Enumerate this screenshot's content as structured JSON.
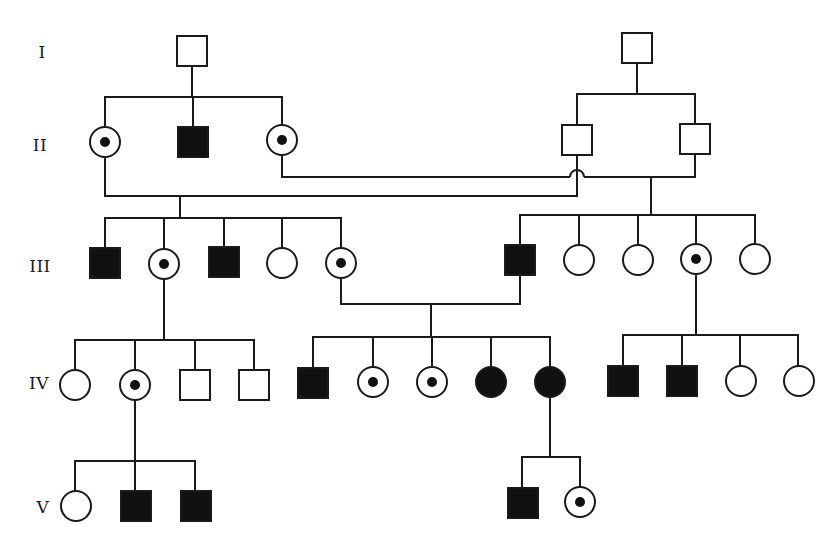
{
  "diagram": {
    "type": "pedigree",
    "colors": {
      "line": "#1a1a1a",
      "fill_affected": "#111111",
      "fill_unaffected": "#ffffff",
      "background": "#ffffff"
    },
    "legend_semantics": {
      "square": "male",
      "circle": "female",
      "filled": "affected",
      "dot": "carrier"
    },
    "generations": [
      {
        "label": "I",
        "x": 42,
        "y": 52
      },
      {
        "label": "II",
        "x": 40,
        "y": 145
      },
      {
        "label": "III",
        "x": 40,
        "y": 266
      },
      {
        "label": "IV",
        "x": 39,
        "y": 383
      },
      {
        "label": "V",
        "x": 43,
        "y": 507
      }
    ],
    "individuals": [
      {
        "id": "I-1",
        "sex": "male",
        "status": "unaffected",
        "cx": 192,
        "cy": 51
      },
      {
        "id": "I-2",
        "sex": "male",
        "status": "unaffected",
        "cx": 637,
        "cy": 48
      },
      {
        "id": "II-1",
        "sex": "female",
        "status": "carrier",
        "cx": 105,
        "cy": 142
      },
      {
        "id": "II-2",
        "sex": "male",
        "status": "affected",
        "cx": 193,
        "cy": 142
      },
      {
        "id": "II-3",
        "sex": "female",
        "status": "carrier",
        "cx": 282,
        "cy": 140
      },
      {
        "id": "II-4",
        "sex": "male",
        "status": "unaffected",
        "cx": 577,
        "cy": 140
      },
      {
        "id": "II-5",
        "sex": "male",
        "status": "unaffected",
        "cx": 695,
        "cy": 139
      },
      {
        "id": "III-1",
        "sex": "male",
        "status": "affected",
        "cx": 105,
        "cy": 263
      },
      {
        "id": "III-2",
        "sex": "female",
        "status": "carrier",
        "cx": 164,
        "cy": 264
      },
      {
        "id": "III-3",
        "sex": "male",
        "status": "affected",
        "cx": 224,
        "cy": 262
      },
      {
        "id": "III-4",
        "sex": "female",
        "status": "unaffected",
        "cx": 282,
        "cy": 263
      },
      {
        "id": "III-5",
        "sex": "female",
        "status": "carrier",
        "cx": 341,
        "cy": 263
      },
      {
        "id": "III-6",
        "sex": "male",
        "status": "affected",
        "cx": 520,
        "cy": 260
      },
      {
        "id": "III-7",
        "sex": "female",
        "status": "unaffected",
        "cx": 579,
        "cy": 260
      },
      {
        "id": "III-8",
        "sex": "female",
        "status": "unaffected",
        "cx": 638,
        "cy": 260
      },
      {
        "id": "III-9",
        "sex": "female",
        "status": "carrier",
        "cx": 696,
        "cy": 259
      },
      {
        "id": "III-10",
        "sex": "female",
        "status": "unaffected",
        "cx": 755,
        "cy": 259
      },
      {
        "id": "IV-1",
        "sex": "female",
        "status": "unaffected",
        "cx": 75,
        "cy": 385
      },
      {
        "id": "IV-2",
        "sex": "female",
        "status": "carrier",
        "cx": 135,
        "cy": 385
      },
      {
        "id": "IV-3",
        "sex": "male",
        "status": "unaffected",
        "cx": 195,
        "cy": 385
      },
      {
        "id": "IV-4",
        "sex": "male",
        "status": "unaffected",
        "cx": 254,
        "cy": 385
      },
      {
        "id": "IV-5",
        "sex": "male",
        "status": "affected",
        "cx": 313,
        "cy": 383
      },
      {
        "id": "IV-6",
        "sex": "female",
        "status": "carrier",
        "cx": 373,
        "cy": 382
      },
      {
        "id": "IV-7",
        "sex": "female",
        "status": "carrier",
        "cx": 432,
        "cy": 382
      },
      {
        "id": "IV-8",
        "sex": "female",
        "status": "affected",
        "cx": 491,
        "cy": 382
      },
      {
        "id": "IV-9",
        "sex": "female",
        "status": "affected",
        "cx": 550,
        "cy": 382
      },
      {
        "id": "IV-10",
        "sex": "male",
        "status": "affected",
        "cx": 623,
        "cy": 381
      },
      {
        "id": "IV-11",
        "sex": "male",
        "status": "affected",
        "cx": 682,
        "cy": 381
      },
      {
        "id": "IV-12",
        "sex": "female",
        "status": "unaffected",
        "cx": 741,
        "cy": 381
      },
      {
        "id": "IV-13",
        "sex": "female",
        "status": "unaffected",
        "cx": 799,
        "cy": 381
      },
      {
        "id": "V-1",
        "sex": "female",
        "status": "unaffected",
        "cx": 76,
        "cy": 506
      },
      {
        "id": "V-2",
        "sex": "male",
        "status": "affected",
        "cx": 136,
        "cy": 506
      },
      {
        "id": "V-3",
        "sex": "male",
        "status": "affected",
        "cx": 196,
        "cy": 506
      },
      {
        "id": "V-4",
        "sex": "male",
        "status": "affected",
        "cx": 523,
        "cy": 503
      },
      {
        "id": "V-5",
        "sex": "female",
        "status": "carrier",
        "cx": 580,
        "cy": 502
      }
    ],
    "lines": [
      {
        "note": "I-1 descent",
        "points": [
          [
            192,
            67
          ],
          [
            192,
            97
          ]
        ]
      },
      {
        "note": "II left sibship",
        "points": [
          [
            105,
            127
          ],
          [
            105,
            97
          ],
          [
            282,
            97
          ],
          [
            282,
            125
          ]
        ]
      },
      {
        "note": "II-2 drop",
        "points": [
          [
            193,
            97
          ],
          [
            193,
            127
          ]
        ]
      },
      {
        "note": "I-2 descent",
        "points": [
          [
            637,
            63
          ],
          [
            637,
            94
          ]
        ]
      },
      {
        "note": "II right sibship",
        "points": [
          [
            577,
            125
          ],
          [
            577,
            94
          ],
          [
            695,
            94
          ],
          [
            695,
            124
          ]
        ]
      },
      {
        "note": "mating II-1 x II-4",
        "points": [
          [
            105,
            157
          ],
          [
            105,
            196
          ],
          [
            577,
            196
          ],
          [
            577,
            155
          ]
        ]
      },
      {
        "note": "mating II-3 x II-5 (left part)",
        "points": [
          [
            282,
            155
          ],
          [
            282,
            177
          ],
          [
            570,
            177
          ]
        ]
      },
      {
        "note": "mating II-3 x II-5 (right part)",
        "points": [
          [
            584,
            177
          ],
          [
            695,
            177
          ],
          [
            695,
            154
          ]
        ]
      },
      {
        "note": "hump over crossing",
        "path": "M570,177 A7,7 0 0 1 584,177"
      },
      {
        "note": "III left descent",
        "points": [
          [
            180,
            196
          ],
          [
            180,
            218
          ]
        ]
      },
      {
        "note": "III left sibship",
        "points": [
          [
            105,
            248
          ],
          [
            105,
            218
          ],
          [
            341,
            218
          ],
          [
            341,
            248
          ]
        ]
      },
      {
        "note": "III-2 drop",
        "points": [
          [
            164,
            218
          ],
          [
            164,
            249
          ]
        ]
      },
      {
        "note": "III-3 drop",
        "points": [
          [
            224,
            218
          ],
          [
            224,
            247
          ]
        ]
      },
      {
        "note": "III-4 drop",
        "points": [
          [
            282,
            218
          ],
          [
            282,
            248
          ]
        ]
      },
      {
        "note": "III right descent",
        "points": [
          [
            651,
            177
          ],
          [
            651,
            215
          ]
        ]
      },
      {
        "note": "III right sibship",
        "points": [
          [
            520,
            245
          ],
          [
            520,
            215
          ],
          [
            755,
            215
          ],
          [
            755,
            244
          ]
        ]
      },
      {
        "note": "III-7 drop",
        "points": [
          [
            579,
            215
          ],
          [
            579,
            245
          ]
        ]
      },
      {
        "note": "III-8 drop",
        "points": [
          [
            638,
            215
          ],
          [
            638,
            245
          ]
        ]
      },
      {
        "note": "III-9 drop",
        "points": [
          [
            696,
            215
          ],
          [
            696,
            244
          ]
        ]
      },
      {
        "note": "mating III-5 x III-6",
        "points": [
          [
            341,
            278
          ],
          [
            341,
            304
          ],
          [
            520,
            304
          ],
          [
            520,
            275
          ]
        ]
      },
      {
        "note": "IV middle descent",
        "points": [
          [
            431,
            304
          ],
          [
            431,
            337
          ]
        ]
      },
      {
        "note": "IV middle sibship",
        "points": [
          [
            313,
            368
          ],
          [
            313,
            337
          ],
          [
            550,
            337
          ],
          [
            550,
            367
          ]
        ]
      },
      {
        "note": "IV-6 drop",
        "points": [
          [
            373,
            337
          ],
          [
            373,
            367
          ]
        ]
      },
      {
        "note": "IV-7 drop",
        "points": [
          [
            432,
            337
          ],
          [
            432,
            367
          ]
        ]
      },
      {
        "note": "IV-8 drop",
        "points": [
          [
            491,
            337
          ],
          [
            491,
            367
          ]
        ]
      },
      {
        "note": "IV left descent",
        "points": [
          [
            164,
            279
          ],
          [
            164,
            340
          ]
        ]
      },
      {
        "note": "IV left sibship",
        "points": [
          [
            75,
            370
          ],
          [
            75,
            340
          ],
          [
            254,
            340
          ],
          [
            254,
            370
          ]
        ]
      },
      {
        "note": "IV-2 drop",
        "points": [
          [
            135,
            340
          ],
          [
            135,
            370
          ]
        ]
      },
      {
        "note": "IV-3 drop",
        "points": [
          [
            195,
            340
          ],
          [
            195,
            370
          ]
        ]
      },
      {
        "note": "IV right descent",
        "points": [
          [
            696,
            274
          ],
          [
            696,
            335
          ]
        ]
      },
      {
        "note": "IV right sibship",
        "points": [
          [
            623,
            366
          ],
          [
            623,
            335
          ],
          [
            798,
            335
          ],
          [
            798,
            366
          ]
        ]
      },
      {
        "note": "IV-11 drop",
        "points": [
          [
            682,
            335
          ],
          [
            682,
            366
          ]
        ]
      },
      {
        "note": "IV-12 drop",
        "points": [
          [
            740,
            335
          ],
          [
            740,
            366
          ]
        ]
      },
      {
        "note": "V left descent",
        "points": [
          [
            135,
            400
          ],
          [
            135,
            491
          ]
        ]
      },
      {
        "note": "V left sibship",
        "points": [
          [
            75,
            491
          ],
          [
            75,
            461
          ],
          [
            195,
            461
          ],
          [
            195,
            491
          ]
        ]
      },
      {
        "note": "V right descent",
        "points": [
          [
            550,
            397
          ],
          [
            550,
            457
          ]
        ]
      },
      {
        "note": "V right sibship",
        "points": [
          [
            522,
            488
          ],
          [
            522,
            457
          ],
          [
            580,
            457
          ],
          [
            580,
            487
          ]
        ]
      }
    ]
  }
}
